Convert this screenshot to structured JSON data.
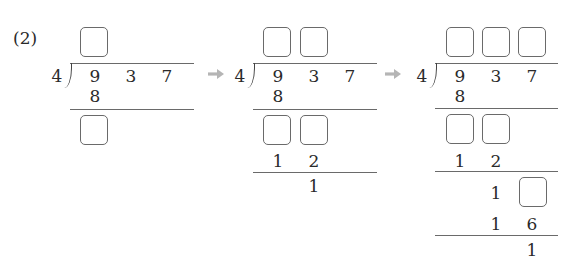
{
  "problem_label": "(2)",
  "divisor": "4",
  "dividend": [
    "9",
    "3",
    "7"
  ],
  "arrow_icon": "right-arrow-icon",
  "colors": {
    "text": "#2a2a2a",
    "lines": "#6a6a6a",
    "arrow": "#b5b5b5",
    "box_border": "#6a6a6a"
  },
  "panels": [
    {
      "quotient_boxes": 1,
      "step1_product": "8",
      "step1_remainder_boxes": 1
    },
    {
      "quotient_boxes": 2,
      "step1_product": "8",
      "step1_remainder_boxes": 2,
      "step2_product": [
        "1",
        "2"
      ],
      "step2_remainder": "1"
    },
    {
      "quotient_boxes": 3,
      "step1_product": "8",
      "step1_remainder_boxes": 2,
      "step2_product": [
        "1",
        "2"
      ],
      "step2_bring_down": [
        "1"
      ],
      "step2_bring_down_boxes": 1,
      "step3_product": [
        "1",
        "6"
      ],
      "final_remainder": "1"
    }
  ]
}
